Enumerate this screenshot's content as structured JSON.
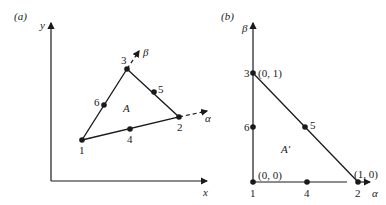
{
  "panel_a": {
    "label": "(a)",
    "y_axis_label": "y",
    "x_axis_label": "x",
    "alpha_label": "α",
    "beta_label": "β",
    "region_label": "A",
    "nodes": [
      {
        "id": "1",
        "x": 82,
        "y": 140,
        "lx": 79,
        "ly": 154
      },
      {
        "id": "2",
        "x": 179,
        "y": 117,
        "lx": 177,
        "ly": 131
      },
      {
        "id": "3",
        "x": 127,
        "y": 69,
        "lx": 121,
        "ly": 63
      },
      {
        "id": "4",
        "x": 130,
        "y": 129,
        "lx": 127,
        "ly": 143
      },
      {
        "id": "5",
        "x": 154,
        "y": 92,
        "lx": 158,
        "ly": 93
      },
      {
        "id": "6",
        "x": 104,
        "y": 105,
        "lx": 94,
        "ly": 106
      }
    ]
  },
  "panel_b": {
    "label": "(b)",
    "beta_axis_label": "β",
    "alpha_axis_label": "α",
    "region_label": "A′",
    "nodes": [
      {
        "id": "1",
        "x": 253,
        "y": 182,
        "lx": 250,
        "ly": 197,
        "coord": "(0, 0)"
      },
      {
        "id": "2",
        "x": 358,
        "y": 182,
        "lx": 355,
        "ly": 197,
        "coord": "(1, 0)"
      },
      {
        "id": "3",
        "x": 253,
        "y": 73,
        "lx": 244,
        "ly": 77,
        "coord": "(0, 1)"
      },
      {
        "id": "4",
        "x": 307,
        "y": 182,
        "lx": 304,
        "ly": 197,
        "coord": ""
      },
      {
        "id": "5",
        "x": 305,
        "y": 127,
        "lx": 310,
        "ly": 129,
        "coord": ""
      },
      {
        "id": "6",
        "x": 253,
        "y": 127,
        "lx": 244,
        "ly": 131,
        "coord": ""
      }
    ]
  }
}
